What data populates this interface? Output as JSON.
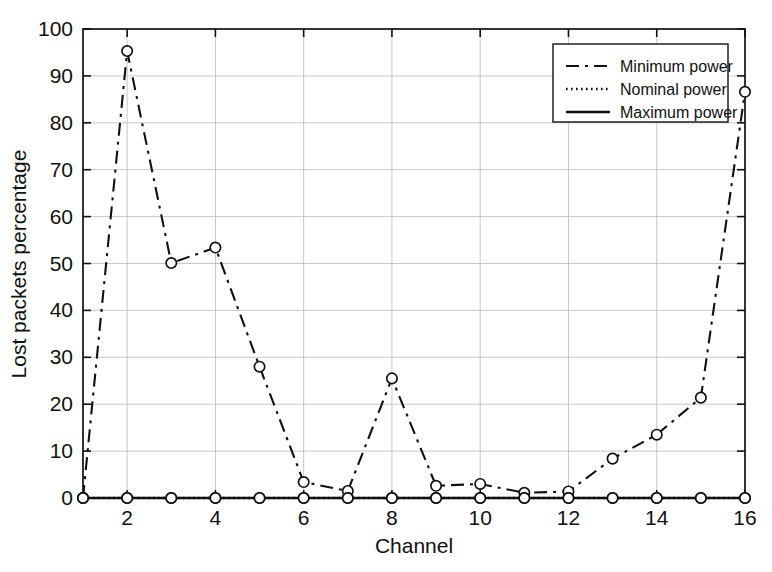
{
  "chart_data": {
    "type": "line",
    "title": "",
    "xlabel": "Channel",
    "ylabel": "Lost packets percentage",
    "xlim": [
      1,
      16
    ],
    "ylim": [
      0,
      100
    ],
    "grid": true,
    "legend_position": "top-right",
    "x": [
      1,
      2,
      3,
      4,
      5,
      6,
      7,
      8,
      9,
      10,
      11,
      12,
      13,
      14,
      15,
      16
    ],
    "xticks": [
      2,
      4,
      6,
      8,
      10,
      12,
      14,
      16
    ],
    "xtick_labels": [
      "2",
      "4",
      "6",
      "8",
      "10",
      "12",
      "14",
      "16"
    ],
    "yticks": [
      0,
      10,
      20,
      30,
      40,
      50,
      60,
      70,
      80,
      90,
      100
    ],
    "ytick_labels": [
      "0",
      "10",
      "20",
      "30",
      "40",
      "50",
      "60",
      "70",
      "80",
      "90",
      "100"
    ],
    "marker": "circle",
    "series": [
      {
        "name": "Minimum power",
        "line_style": "dash-dot",
        "color": "#111111",
        "values": [
          0,
          95.3,
          50.1,
          53.4,
          28.0,
          3.4,
          1.5,
          25.5,
          2.6,
          3.0,
          1.1,
          1.4,
          8.4,
          13.5,
          21.4,
          86.6
        ]
      },
      {
        "name": "Nominal power",
        "line_style": "dotted",
        "color": "#111111",
        "values": [
          0,
          0,
          0,
          0,
          0,
          0,
          0,
          0,
          0,
          0,
          0,
          0,
          0,
          0,
          0,
          0
        ]
      },
      {
        "name": "Maximum power",
        "line_style": "solid",
        "color": "#111111",
        "values": [
          0,
          0,
          0,
          0,
          0,
          0,
          0,
          0,
          0,
          0,
          0,
          0,
          0,
          0,
          0,
          0
        ]
      }
    ]
  },
  "legend": {
    "entries": [
      {
        "label": "Minimum power",
        "style": "dash-dot"
      },
      {
        "label": "Nominal power",
        "style": "dotted"
      },
      {
        "label": "Maximum power",
        "style": "solid"
      }
    ]
  }
}
